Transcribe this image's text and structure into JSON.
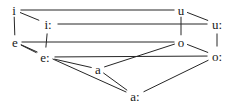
{
  "diagram": {
    "type": "vowel-chart",
    "stroke_color": "#262626",
    "background_color": "#ffffff",
    "vowels": [
      {
        "id": "i",
        "label": "i",
        "x": 14,
        "y": 10
      },
      {
        "id": "i-long",
        "label": "i:",
        "x": 48,
        "y": 24
      },
      {
        "id": "u",
        "label": "u",
        "x": 181,
        "y": 10
      },
      {
        "id": "u-long",
        "label": "u:",
        "x": 217,
        "y": 24
      },
      {
        "id": "e",
        "label": "e",
        "x": 15,
        "y": 42
      },
      {
        "id": "e-long",
        "label": "e:",
        "x": 45,
        "y": 57
      },
      {
        "id": "o",
        "label": "o",
        "x": 181,
        "y": 42
      },
      {
        "id": "o-long",
        "label": "o:",
        "x": 217,
        "y": 56
      },
      {
        "id": "a",
        "label": "a",
        "x": 98,
        "y": 69
      },
      {
        "id": "a-long",
        "label": "a:",
        "x": 135,
        "y": 96
      }
    ],
    "edges": [
      {
        "from": "i",
        "to": "u"
      },
      {
        "from": "i",
        "to": "i-long"
      },
      {
        "from": "i-long",
        "to": "u-long"
      },
      {
        "from": "u",
        "to": "u-long"
      },
      {
        "from": "i",
        "to": "e"
      },
      {
        "from": "i-long",
        "to": "e-long"
      },
      {
        "from": "u",
        "to": "o"
      },
      {
        "from": "u-long",
        "to": "o-long"
      },
      {
        "from": "e",
        "to": "o"
      },
      {
        "from": "e",
        "to": "e-long"
      },
      {
        "from": "e-long",
        "to": "o-long"
      },
      {
        "from": "o",
        "to": "o-long"
      },
      {
        "from": "e-long",
        "to": "a"
      },
      {
        "from": "a",
        "to": "o"
      },
      {
        "from": "e",
        "to": "a-long"
      },
      {
        "from": "a",
        "to": "a-long"
      },
      {
        "from": "o-long",
        "to": "a-long"
      }
    ]
  }
}
